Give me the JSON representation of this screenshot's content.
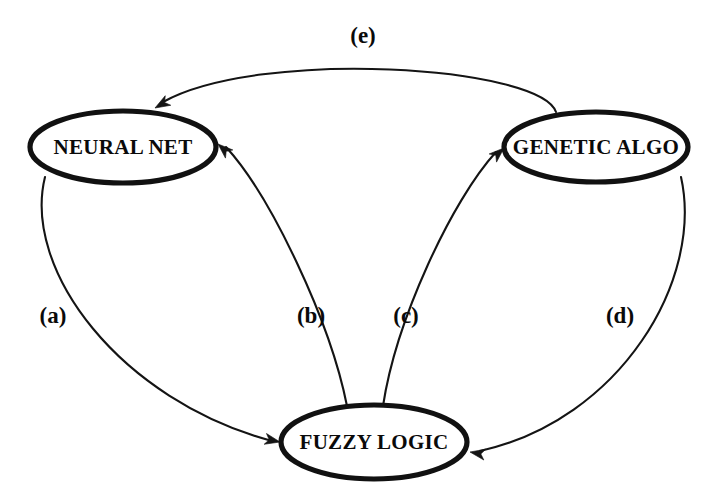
{
  "diagram": {
    "type": "directed-graph",
    "background_color": "#ffffff",
    "stroke_color": "#141414",
    "nodes": [
      {
        "id": "neural-net",
        "label": "NEURAL NET",
        "shape": "ellipse",
        "cx": 123,
        "cy": 147,
        "rx": 93,
        "ry": 36
      },
      {
        "id": "genetic-algo",
        "label": "GENETIC ALGO",
        "shape": "ellipse",
        "cx": 596,
        "cy": 147,
        "rx": 92,
        "ry": 35
      },
      {
        "id": "fuzzy-logic",
        "label": "FUZZY LOGIC",
        "shape": "ellipse",
        "cx": 374,
        "cy": 442,
        "rx": 93,
        "ry": 37
      }
    ],
    "edges": [
      {
        "id": "edge-a",
        "label": "(a)",
        "from": "neural-net",
        "to": "fuzzy-logic",
        "label_x": 53,
        "label_y": 318,
        "path": "M 45,177 C 22,270 120,400 272,441",
        "arrow_x": 280,
        "arrow_y": 442,
        "arrow_angle": 12
      },
      {
        "id": "edge-b",
        "label": "(b)",
        "from": "fuzzy-logic",
        "to": "neural-net",
        "label_x": 311,
        "label_y": 318,
        "path": "M 347,406 C 330,320 270,195 226,147",
        "arrow_x": 218,
        "arrow_y": 144,
        "arrow_angle": 222
      },
      {
        "id": "edge-c",
        "label": "(c)",
        "from": "fuzzy-logic",
        "to": "genetic-algo",
        "label_x": 406,
        "label_y": 318,
        "path": "M 383,406 C 396,320 452,200 496,152",
        "arrow_x": 504,
        "arrow_y": 148,
        "arrow_angle": -42
      },
      {
        "id": "edge-d",
        "label": "(d)",
        "from": "genetic-algo",
        "to": "fuzzy-logic",
        "label_x": 620,
        "label_y": 318,
        "path": "M 681,177 C 704,280 620,420 480,451",
        "arrow_x": 470,
        "arrow_y": 452,
        "arrow_angle": 190
      },
      {
        "id": "edge-e",
        "label": "(e)",
        "from": "genetic-algo",
        "to": "neural-net",
        "label_x": 363,
        "label_y": 38,
        "path": "M 556,112 C 540,66 260,48 163,102",
        "arrow_x": 155,
        "arrow_y": 108,
        "arrow_angle": 150
      }
    ]
  }
}
